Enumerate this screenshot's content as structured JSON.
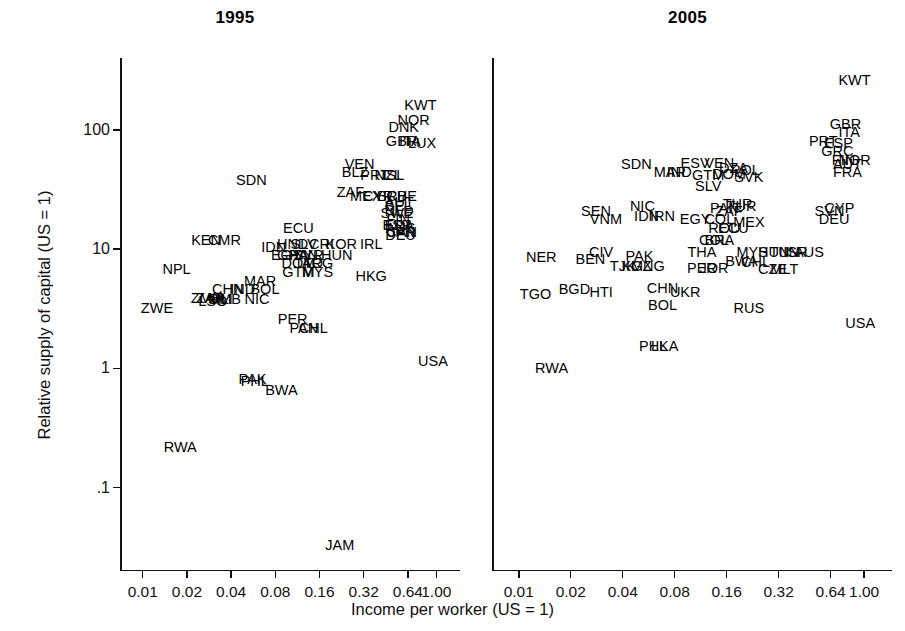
{
  "figure": {
    "xlabel": "Income per worker (US = 1)",
    "ylabel": "Relative supply of capital (US = 1)"
  },
  "chart_data": {
    "type": "scatter",
    "title": "",
    "xlabel": "Income per worker (US = 1)",
    "ylabel": "Relative supply of capital (US = 1)",
    "xscale": "log2",
    "yscale": "log10",
    "xticks": [
      "0.01",
      "0.02",
      "0.04",
      "0.08",
      "0.16",
      "0.32",
      "0.64",
      "1.00"
    ],
    "xtick_values": [
      0.01,
      0.02,
      0.04,
      0.08,
      0.16,
      0.32,
      0.64,
      1.0
    ],
    "yticks": [
      "100",
      "10",
      "1",
      ".1"
    ],
    "ytick_values": [
      100,
      10,
      1,
      0.1
    ],
    "xlim": [
      0.007,
      1.45
    ],
    "ylim": [
      0.02,
      400
    ],
    "grid": false,
    "legend": null,
    "marker": "text-label",
    "panels": [
      {
        "title": "1995",
        "points": [
          {
            "label": "KWT",
            "x": 0.78,
            "y": 160
          },
          {
            "label": "NOR",
            "x": 0.7,
            "y": 120
          },
          {
            "label": "DNK",
            "x": 0.6,
            "y": 105
          },
          {
            "label": "GBR",
            "x": 0.58,
            "y": 80
          },
          {
            "label": "ITA",
            "x": 0.66,
            "y": 80
          },
          {
            "label": "LUX",
            "x": 0.8,
            "y": 78
          },
          {
            "label": "VEN",
            "x": 0.3,
            "y": 52
          },
          {
            "label": "BLZ",
            "x": 0.28,
            "y": 44
          },
          {
            "label": "PRT",
            "x": 0.38,
            "y": 42
          },
          {
            "label": "NZL",
            "x": 0.47,
            "y": 42
          },
          {
            "label": "ISL",
            "x": 0.51,
            "y": 42
          },
          {
            "label": "SDN",
            "x": 0.055,
            "y": 38
          },
          {
            "label": "ZAF",
            "x": 0.26,
            "y": 30
          },
          {
            "label": "MEX",
            "x": 0.33,
            "y": 28
          },
          {
            "label": "CYP",
            "x": 0.4,
            "y": 28
          },
          {
            "label": "BRB",
            "x": 0.5,
            "y": 28
          },
          {
            "label": "CHE",
            "x": 0.58,
            "y": 28
          },
          {
            "label": "AUT",
            "x": 0.56,
            "y": 25
          },
          {
            "label": "BEL",
            "x": 0.55,
            "y": 23
          },
          {
            "label": "NLD",
            "x": 0.56,
            "y": 21
          },
          {
            "label": "SWE",
            "x": 0.54,
            "y": 20
          },
          {
            "label": "FIN",
            "x": 0.55,
            "y": 18
          },
          {
            "label": "ESP",
            "x": 0.54,
            "y": 16
          },
          {
            "label": "FRA",
            "x": 0.56,
            "y": 16
          },
          {
            "label": "AUS",
            "x": 0.57,
            "y": 15
          },
          {
            "label": "CAN",
            "x": 0.58,
            "y": 14
          },
          {
            "label": "JPN",
            "x": 0.58,
            "y": 14
          },
          {
            "label": "DEU",
            "x": 0.57,
            "y": 13
          },
          {
            "label": "ECU",
            "x": 0.115,
            "y": 15
          },
          {
            "label": "KEN",
            "x": 0.027,
            "y": 12
          },
          {
            "label": "CMR",
            "x": 0.036,
            "y": 12
          },
          {
            "label": "IDN",
            "x": 0.078,
            "y": 10.5
          },
          {
            "label": "HND",
            "x": 0.105,
            "y": 11
          },
          {
            "label": "SLV",
            "x": 0.125,
            "y": 11
          },
          {
            "label": "CRI",
            "x": 0.165,
            "y": 11
          },
          {
            "label": "KOR",
            "x": 0.225,
            "y": 11
          },
          {
            "label": "IRL",
            "x": 0.36,
            "y": 11
          },
          {
            "label": "EGY",
            "x": 0.095,
            "y": 9
          },
          {
            "label": "GHA",
            "x": 0.105,
            "y": 9
          },
          {
            "label": "PAN",
            "x": 0.125,
            "y": 9
          },
          {
            "label": "SYR",
            "x": 0.135,
            "y": 9
          },
          {
            "label": "HUN",
            "x": 0.21,
            "y": 9
          },
          {
            "label": "DOM",
            "x": 0.115,
            "y": 7.6
          },
          {
            "label": "TTO",
            "x": 0.135,
            "y": 7.6
          },
          {
            "label": "ARG",
            "x": 0.155,
            "y": 7.6
          },
          {
            "label": "GTM",
            "x": 0.115,
            "y": 6.4
          },
          {
            "label": "MYS",
            "x": 0.155,
            "y": 6.4
          },
          {
            "label": "HKG",
            "x": 0.36,
            "y": 6.0
          },
          {
            "label": "NPL",
            "x": 0.017,
            "y": 6.8
          },
          {
            "label": "MAR",
            "x": 0.063,
            "y": 5.4
          },
          {
            "label": "CHN",
            "x": 0.038,
            "y": 4.6
          },
          {
            "label": "IND",
            "x": 0.048,
            "y": 4.6
          },
          {
            "label": "BOL",
            "x": 0.068,
            "y": 4.6
          },
          {
            "label": "ZMB",
            "x": 0.027,
            "y": 3.9
          },
          {
            "label": "ZAR",
            "x": 0.029,
            "y": 3.9
          },
          {
            "label": "LSO",
            "x": 0.03,
            "y": 3.7
          },
          {
            "label": "MLI",
            "x": 0.034,
            "y": 3.8
          },
          {
            "label": "GMB",
            "x": 0.036,
            "y": 3.8
          },
          {
            "label": "NIC",
            "x": 0.06,
            "y": 3.8
          },
          {
            "label": "ZWE",
            "x": 0.0125,
            "y": 3.2
          },
          {
            "label": "PER",
            "x": 0.105,
            "y": 2.6
          },
          {
            "label": "PAN",
            "x": 0.125,
            "y": 2.2
          },
          {
            "label": "CHL",
            "x": 0.145,
            "y": 2.2
          },
          {
            "label": "USA",
            "x": 0.95,
            "y": 1.15
          },
          {
            "label": "PAK",
            "x": 0.056,
            "y": 0.82
          },
          {
            "label": "PHL",
            "x": 0.058,
            "y": 0.78
          },
          {
            "label": "BWA",
            "x": 0.088,
            "y": 0.66
          },
          {
            "label": "RWA",
            "x": 0.018,
            "y": 0.22
          },
          {
            "label": "JAM",
            "x": 0.22,
            "y": 0.033
          }
        ]
      },
      {
        "title": "2005",
        "points": [
          {
            "label": "KWT",
            "x": 0.88,
            "y": 260
          },
          {
            "label": "GBR",
            "x": 0.78,
            "y": 112
          },
          {
            "label": "ITA",
            "x": 0.82,
            "y": 95
          },
          {
            "label": "PRT",
            "x": 0.58,
            "y": 80
          },
          {
            "label": "ESP",
            "x": 0.71,
            "y": 78
          },
          {
            "label": "GRC",
            "x": 0.7,
            "y": 66
          },
          {
            "label": "FIN",
            "x": 0.76,
            "y": 56
          },
          {
            "label": "NOR",
            "x": 0.88,
            "y": 56
          },
          {
            "label": "AUT",
            "x": 0.8,
            "y": 52
          },
          {
            "label": "FRA",
            "x": 0.8,
            "y": 44
          },
          {
            "label": "SDN",
            "x": 0.048,
            "y": 52
          },
          {
            "label": "ESV",
            "x": 0.105,
            "y": 53
          },
          {
            "label": "VEN",
            "x": 0.145,
            "y": 53
          },
          {
            "label": "DZA",
            "x": 0.175,
            "y": 48
          },
          {
            "label": "POL",
            "x": 0.205,
            "y": 46
          },
          {
            "label": "MAR",
            "x": 0.075,
            "y": 44
          },
          {
            "label": "IND",
            "x": 0.085,
            "y": 44
          },
          {
            "label": "GTM",
            "x": 0.125,
            "y": 42
          },
          {
            "label": "DOM",
            "x": 0.165,
            "y": 43
          },
          {
            "label": "SVK",
            "x": 0.215,
            "y": 40
          },
          {
            "label": "SLV",
            "x": 0.125,
            "y": 34
          },
          {
            "label": "SEN",
            "x": 0.028,
            "y": 21
          },
          {
            "label": "VNM",
            "x": 0.032,
            "y": 18
          },
          {
            "label": "NIC",
            "x": 0.052,
            "y": 23
          },
          {
            "label": "IDN",
            "x": 0.055,
            "y": 19
          },
          {
            "label": "IRN",
            "x": 0.068,
            "y": 19
          },
          {
            "label": "EGY",
            "x": 0.105,
            "y": 18
          },
          {
            "label": "PAN",
            "x": 0.155,
            "y": 22
          },
          {
            "label": "THR",
            "x": 0.185,
            "y": 24
          },
          {
            "label": "TUR",
            "x": 0.195,
            "y": 23
          },
          {
            "label": "ZAF",
            "x": 0.165,
            "y": 21
          },
          {
            "label": "COL",
            "x": 0.145,
            "y": 18
          },
          {
            "label": "MEX",
            "x": 0.215,
            "y": 17
          },
          {
            "label": "ROU",
            "x": 0.155,
            "y": 15
          },
          {
            "label": "ECU",
            "x": 0.175,
            "y": 15
          },
          {
            "label": "SVN",
            "x": 0.63,
            "y": 21
          },
          {
            "label": "CYP",
            "x": 0.72,
            "y": 22
          },
          {
            "label": "DEU",
            "x": 0.67,
            "y": 18
          },
          {
            "label": "BRA",
            "x": 0.145,
            "y": 12
          },
          {
            "label": "COL",
            "x": 0.135,
            "y": 12
          },
          {
            "label": "THA",
            "x": 0.115,
            "y": 9.5
          },
          {
            "label": "MYS",
            "x": 0.225,
            "y": 9.5
          },
          {
            "label": "HUN",
            "x": 0.3,
            "y": 9.5
          },
          {
            "label": "TUN",
            "x": 0.345,
            "y": 9.5
          },
          {
            "label": "ISR",
            "x": 0.4,
            "y": 9.5
          },
          {
            "label": "AUS",
            "x": 0.48,
            "y": 9.5
          },
          {
            "label": "NER",
            "x": 0.0135,
            "y": 8.6
          },
          {
            "label": "CIV",
            "x": 0.03,
            "y": 9.5
          },
          {
            "label": "BEN",
            "x": 0.026,
            "y": 8.2
          },
          {
            "label": "PAK",
            "x": 0.05,
            "y": 8.8
          },
          {
            "label": "TJK",
            "x": 0.04,
            "y": 7.2
          },
          {
            "label": "KGZ",
            "x": 0.048,
            "y": 7.2
          },
          {
            "label": "MNG",
            "x": 0.056,
            "y": 7.2
          },
          {
            "label": "PER",
            "x": 0.115,
            "y": 7.0
          },
          {
            "label": "JOR",
            "x": 0.135,
            "y": 7.0
          },
          {
            "label": "BWA",
            "x": 0.195,
            "y": 8.0
          },
          {
            "label": "CHL",
            "x": 0.235,
            "y": 7.8
          },
          {
            "label": "CZE",
            "x": 0.295,
            "y": 6.8
          },
          {
            "label": "MLT",
            "x": 0.345,
            "y": 6.8
          },
          {
            "label": "TGO",
            "x": 0.0125,
            "y": 4.2
          },
          {
            "label": "BGD",
            "x": 0.021,
            "y": 4.6
          },
          {
            "label": "HTI",
            "x": 0.03,
            "y": 4.4
          },
          {
            "label": "CHN",
            "x": 0.068,
            "y": 4.7
          },
          {
            "label": "UKR",
            "x": 0.092,
            "y": 4.4
          },
          {
            "label": "BOL",
            "x": 0.068,
            "y": 3.4
          },
          {
            "label": "RUS",
            "x": 0.215,
            "y": 3.2
          },
          {
            "label": "USA",
            "x": 0.95,
            "y": 2.4
          },
          {
            "label": "PHL",
            "x": 0.06,
            "y": 1.55
          },
          {
            "label": "LKA",
            "x": 0.07,
            "y": 1.55
          },
          {
            "label": "RWA",
            "x": 0.0155,
            "y": 1.0
          }
        ]
      }
    ]
  }
}
